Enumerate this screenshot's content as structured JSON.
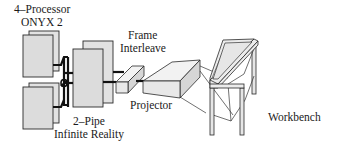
{
  "diagram": {
    "type": "system-architecture",
    "labels": {
      "processor_line1": "4–Processor",
      "processor_line2": "ONYX 2",
      "pipe_line1": "2–Pipe",
      "pipe_line2": "Infinite Reality",
      "frame_line1": "Frame",
      "frame_line2": "Interleave",
      "projector": "Projector",
      "workbench": "Workbench"
    },
    "components": [
      {
        "id": "processor-upper",
        "kind": "computer-unit"
      },
      {
        "id": "processor-lower",
        "kind": "computer-unit"
      },
      {
        "id": "graphics-pipes",
        "kind": "computer-unit"
      },
      {
        "id": "frame-interleave",
        "kind": "box"
      },
      {
        "id": "projector",
        "kind": "projector"
      },
      {
        "id": "workbench",
        "kind": "table-display"
      }
    ],
    "connections": [
      {
        "from": "processor-upper",
        "to": "graphics-pipes"
      },
      {
        "from": "processor-lower",
        "to": "graphics-pipes"
      },
      {
        "from": "graphics-pipes",
        "to": "frame-interleave"
      },
      {
        "from": "frame-interleave",
        "to": "projector"
      },
      {
        "from": "projector",
        "to": "workbench"
      }
    ]
  }
}
